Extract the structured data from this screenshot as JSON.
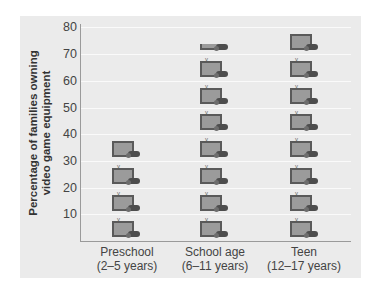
{
  "chart_data": {
    "type": "bar",
    "subtype": "pictograph",
    "title": "",
    "xlabel": "",
    "ylabel": "Percentage of families owning video game equipment",
    "ylabel_lines": [
      "Percentage of families owning",
      "video game equipment"
    ],
    "ylim": [
      0,
      80
    ],
    "yticks": [
      10,
      20,
      30,
      40,
      50,
      60,
      70,
      80
    ],
    "grid": true,
    "icon_unit": 10,
    "icon": "tv-with-game-controller-icon",
    "categories": [
      "Preschool (2–5 years)",
      "School age (6–11 years)",
      "Teen (12–17 years)"
    ],
    "category_lines": [
      [
        "Preschool",
        "(2–5 years)"
      ],
      [
        "School age",
        "(6–11 years)"
      ],
      [
        "Teen",
        "(12–17 years)"
      ]
    ],
    "values": [
      38,
      73,
      79
    ]
  },
  "ui": {
    "tick_labels": [
      "80",
      "70",
      "60",
      "50",
      "40",
      "30",
      "20",
      "10"
    ]
  },
  "colors": {
    "panel": "#ebebeb",
    "gridline": "#fafafa",
    "axis": "#9a9a9a",
    "icon_frame": "#5a5a5a",
    "icon_fill": "#9b9b9b",
    "text": "#444444"
  }
}
